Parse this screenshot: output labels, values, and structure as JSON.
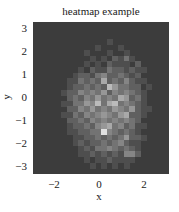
{
  "chart_data": {
    "type": "heatmap",
    "title": "heatmap example",
    "xlabel": "x",
    "ylabel": "y",
    "xlim": [
      -3.0,
      3.05
    ],
    "ylim": [
      -3.3,
      3.3
    ],
    "xticks": [
      -2,
      0,
      2
    ],
    "yticks": [
      3,
      2,
      1,
      0,
      -1,
      -2,
      -3
    ],
    "colormap": "gray",
    "n_cols": 24,
    "n_rows": 27,
    "note": "2D histogram of approximately normally distributed points; values are relative counts (0-10) per bin, rows listed from top (y high) to bottom (y low).",
    "values": [
      [
        0,
        0,
        0,
        0,
        0,
        0,
        0,
        0,
        0,
        0,
        0,
        0,
        0,
        0,
        0,
        0,
        0,
        0,
        0,
        0,
        0,
        0,
        0,
        0
      ],
      [
        0,
        0,
        0,
        0,
        0,
        0,
        0,
        0,
        0,
        0,
        0,
        0,
        0,
        0,
        0,
        0,
        0,
        0,
        0,
        0,
        0,
        0,
        0,
        0
      ],
      [
        0,
        0,
        0,
        0,
        0,
        0,
        0,
        0,
        0,
        0,
        0,
        0,
        0,
        0,
        0,
        0,
        0,
        0,
        0,
        0,
        0,
        0,
        0,
        0
      ],
      [
        0,
        0,
        0,
        0,
        0,
        0,
        0,
        0,
        0,
        0,
        0,
        0,
        0,
        1,
        0,
        0,
        0,
        0,
        0,
        0,
        0,
        0,
        0,
        0
      ],
      [
        0,
        0,
        0,
        0,
        0,
        0,
        0,
        0,
        0,
        0,
        0,
        1,
        0,
        0,
        0,
        1,
        0,
        0,
        0,
        0,
        0,
        0,
        0,
        0
      ],
      [
        0,
        0,
        0,
        0,
        0,
        0,
        0,
        0,
        0,
        1,
        0,
        0,
        0,
        1,
        0,
        0,
        1,
        0,
        0,
        0,
        0,
        0,
        0,
        0
      ],
      [
        0,
        0,
        0,
        0,
        0,
        0,
        0,
        0,
        0,
        0,
        1,
        0,
        1,
        0,
        2,
        1,
        3,
        1,
        0,
        0,
        0,
        0,
        0,
        0
      ],
      [
        0,
        0,
        0,
        0,
        0,
        0,
        0,
        0,
        0,
        1,
        0,
        1,
        0,
        2,
        1,
        1,
        1,
        0,
        2,
        0,
        0,
        0,
        0,
        0
      ],
      [
        0,
        0,
        0,
        0,
        0,
        0,
        0,
        0,
        1,
        0,
        2,
        1,
        1,
        3,
        2,
        2,
        1,
        2,
        1,
        1,
        0,
        0,
        0,
        0
      ],
      [
        0,
        0,
        0,
        0,
        0,
        0,
        0,
        1,
        2,
        2,
        1,
        3,
        4,
        2,
        2,
        3,
        2,
        1,
        2,
        0,
        0,
        0,
        0,
        0
      ],
      [
        0,
        0,
        0,
        0,
        0,
        0,
        1,
        1,
        3,
        2,
        3,
        2,
        6,
        2,
        3,
        2,
        4,
        2,
        1,
        1,
        0,
        0,
        0,
        0
      ],
      [
        0,
        0,
        0,
        0,
        0,
        0,
        1,
        2,
        2,
        3,
        2,
        3,
        2,
        7,
        5,
        3,
        3,
        2,
        2,
        0,
        1,
        0,
        0,
        0
      ],
      [
        0,
        0,
        0,
        0,
        0,
        1,
        2,
        2,
        4,
        3,
        4,
        3,
        5,
        2,
        4,
        3,
        4,
        3,
        2,
        1,
        0,
        0,
        0,
        0
      ],
      [
        0,
        0,
        0,
        0,
        0,
        0,
        2,
        3,
        2,
        4,
        3,
        5,
        3,
        4,
        3,
        6,
        5,
        2,
        3,
        1,
        0,
        0,
        0,
        0
      ],
      [
        0,
        0,
        0,
        0,
        0,
        1,
        1,
        3,
        3,
        5,
        4,
        7,
        3,
        6,
        7,
        3,
        4,
        3,
        2,
        1,
        0,
        0,
        0,
        0
      ],
      [
        0,
        0,
        0,
        0,
        0,
        0,
        2,
        2,
        4,
        3,
        5,
        3,
        4,
        3,
        5,
        4,
        3,
        5,
        2,
        1,
        1,
        0,
        0,
        0
      ],
      [
        0,
        0,
        0,
        0,
        0,
        1,
        1,
        3,
        2,
        4,
        3,
        4,
        5,
        4,
        3,
        5,
        6,
        2,
        2,
        1,
        0,
        0,
        0,
        0
      ],
      [
        0,
        0,
        0,
        0,
        0,
        0,
        2,
        2,
        3,
        2,
        4,
        3,
        4,
        3,
        4,
        3,
        4,
        3,
        2,
        0,
        0,
        0,
        0,
        0
      ],
      [
        0,
        0,
        0,
        0,
        0,
        0,
        1,
        2,
        2,
        3,
        2,
        4,
        5,
        6,
        3,
        4,
        2,
        3,
        1,
        1,
        0,
        0,
        0,
        0
      ],
      [
        0,
        0,
        0,
        0,
        0,
        0,
        1,
        1,
        2,
        2,
        3,
        3,
        9,
        4,
        3,
        2,
        3,
        2,
        1,
        0,
        0,
        0,
        0,
        0
      ],
      [
        0,
        0,
        0,
        0,
        0,
        0,
        0,
        1,
        1,
        2,
        2,
        3,
        2,
        3,
        2,
        3,
        5,
        2,
        2,
        1,
        0,
        0,
        0,
        0
      ],
      [
        0,
        0,
        0,
        0,
        0,
        0,
        0,
        1,
        2,
        1,
        2,
        2,
        3,
        2,
        3,
        4,
        2,
        1,
        1,
        0,
        0,
        0,
        0,
        0
      ],
      [
        0,
        0,
        0,
        0,
        0,
        0,
        0,
        0,
        1,
        2,
        1,
        3,
        3,
        4,
        3,
        2,
        3,
        2,
        1,
        0,
        0,
        0,
        0,
        0
      ],
      [
        0,
        0,
        0,
        0,
        0,
        0,
        0,
        0,
        1,
        1,
        2,
        1,
        2,
        1,
        2,
        1,
        4,
        4,
        2,
        0,
        0,
        0,
        0,
        0
      ],
      [
        0,
        0,
        0,
        0,
        0,
        0,
        0,
        0,
        0,
        1,
        0,
        1,
        1,
        2,
        1,
        1,
        1,
        1,
        0,
        0,
        0,
        0,
        0,
        0
      ],
      [
        0,
        0,
        0,
        0,
        0,
        0,
        0,
        0,
        0,
        0,
        1,
        0,
        1,
        0,
        1,
        0,
        1,
        0,
        0,
        0,
        0,
        0,
        0,
        0
      ],
      [
        0,
        0,
        0,
        0,
        0,
        0,
        0,
        0,
        0,
        0,
        0,
        0,
        0,
        0,
        0,
        0,
        0,
        0,
        0,
        0,
        0,
        0,
        0,
        0
      ]
    ],
    "vmax": 10,
    "low_color": "#3c3c3c",
    "high_color": "#f2f2f2"
  }
}
